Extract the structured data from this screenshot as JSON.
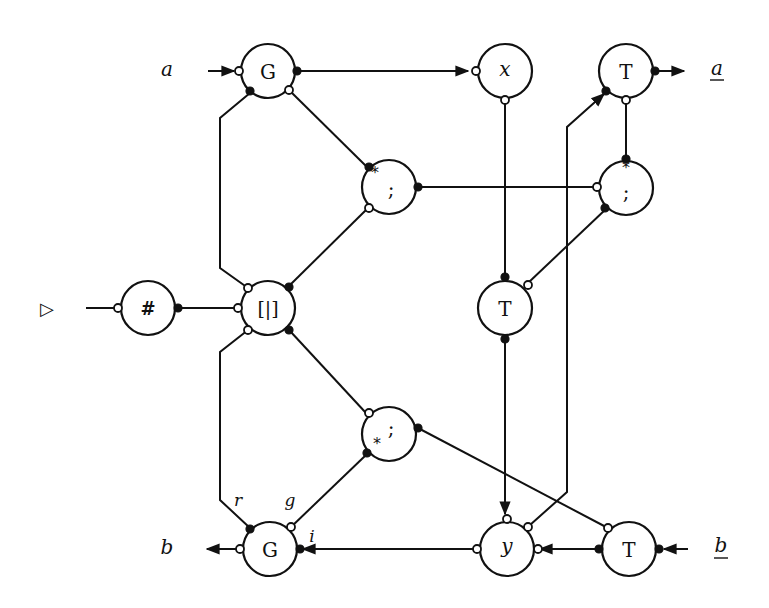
{
  "diagram": {
    "type": "interaction-net",
    "external_labels": {
      "a_in": "a",
      "a_out": "a",
      "b_out": "b",
      "b_in": "b",
      "start": "▷"
    },
    "wire_labels": {
      "r": "r",
      "g": "g",
      "i": "i"
    },
    "nodes": [
      {
        "id": "G_top",
        "label": "G"
      },
      {
        "id": "x",
        "label": "x"
      },
      {
        "id": "T_top",
        "label": "T"
      },
      {
        "id": "semi_star_top",
        "label": ";",
        "mark": "*"
      },
      {
        "id": "semi_star_right",
        "label": ";",
        "mark": "*"
      },
      {
        "id": "hash",
        "label": "#"
      },
      {
        "id": "choice",
        "label": "[|]"
      },
      {
        "id": "T_mid",
        "label": "T"
      },
      {
        "id": "semi_star_low",
        "label": ";",
        "mark": "*"
      },
      {
        "id": "G_bottom",
        "label": "G"
      },
      {
        "id": "y",
        "label": "y"
      },
      {
        "id": "T_bottom",
        "label": "T"
      }
    ]
  }
}
